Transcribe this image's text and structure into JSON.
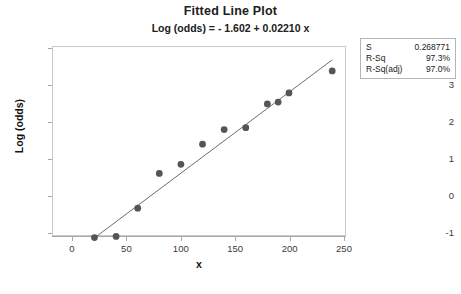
{
  "chart_data": {
    "type": "scatter",
    "title": "Fitted Line Plot",
    "subtitle": "Log (odds) = - 1.602 + 0.02210 x",
    "xlabel": "x",
    "ylabel": "Log (odds)",
    "xlim": [
      0,
      250
    ],
    "ylim": [
      -1.6,
      4.2
    ],
    "xticks": [
      0,
      50,
      100,
      150,
      200,
      250
    ],
    "yticks": [
      -1,
      0,
      1,
      2,
      3,
      4
    ],
    "grid": false,
    "legend": "none",
    "series": [
      {
        "name": "observations",
        "marker": "filled-circle",
        "color": "#555555",
        "points": [
          {
            "x": 20,
            "y": -1.15
          },
          {
            "x": 40,
            "y": -1.12
          },
          {
            "x": 60,
            "y": -0.35
          },
          {
            "x": 80,
            "y": 0.6
          },
          {
            "x": 100,
            "y": 0.85
          },
          {
            "x": 120,
            "y": 1.4
          },
          {
            "x": 140,
            "y": 1.8
          },
          {
            "x": 160,
            "y": 1.85
          },
          {
            "x": 180,
            "y": 2.5
          },
          {
            "x": 190,
            "y": 2.55
          },
          {
            "x": 200,
            "y": 2.8
          },
          {
            "x": 240,
            "y": 3.4
          }
        ]
      }
    ],
    "fit_line": {
      "name": "regression-line",
      "color": "#6b6b6b",
      "intercept": -1.602,
      "slope": 0.0221,
      "x_start": 20,
      "x_end": 240
    }
  },
  "stats": {
    "rows": [
      {
        "key": "S",
        "value": "0.268771"
      },
      {
        "key": "R-Sq",
        "value": "97.3%"
      },
      {
        "key": "R-Sq(adj)",
        "value": "97.0%"
      }
    ]
  },
  "axis_labels": {
    "x_ticks": [
      "0",
      "50",
      "100",
      "150",
      "200",
      "250"
    ],
    "y_ticks": [
      "4",
      "3",
      "2",
      "1",
      "0",
      "-1"
    ]
  }
}
